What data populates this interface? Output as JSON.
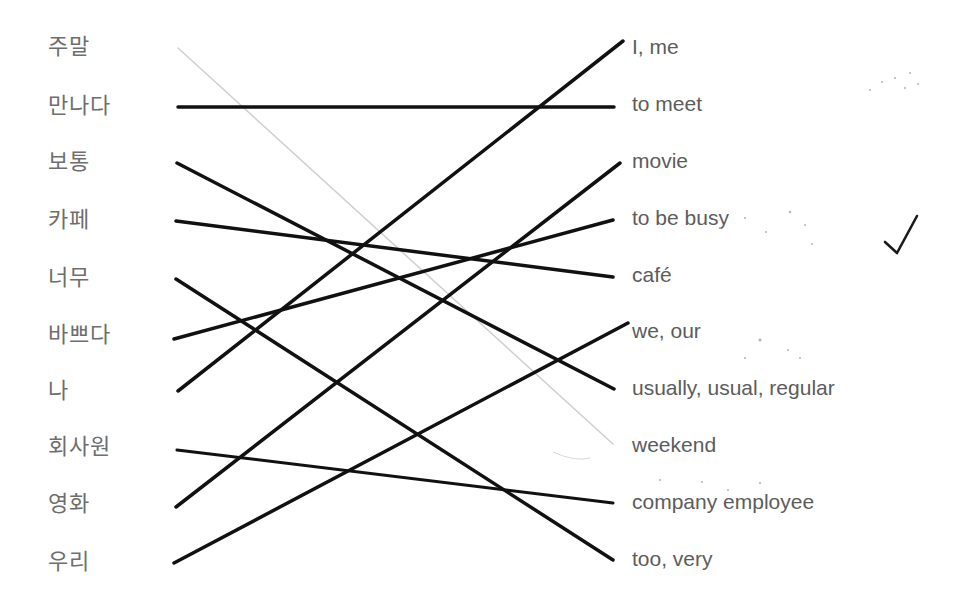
{
  "korean_words": [
    {
      "text": "주말",
      "y": 48
    },
    {
      "text": "만나다",
      "y": 107
    },
    {
      "text": "보통",
      "y": 163
    },
    {
      "text": "카페",
      "y": 221
    },
    {
      "text": "너무",
      "y": 279
    },
    {
      "text": "바쁘다",
      "y": 336
    },
    {
      "text": "나",
      "y": 392
    },
    {
      "text": "회사원",
      "y": 448
    },
    {
      "text": "영화",
      "y": 505
    },
    {
      "text": "우리",
      "y": 563
    }
  ],
  "english_words": [
    {
      "text": "I, me",
      "y": 48
    },
    {
      "text": "to meet",
      "y": 105
    },
    {
      "text": "movie",
      "y": 162
    },
    {
      "text": "to be busy",
      "y": 219
    },
    {
      "text": "café",
      "y": 276
    },
    {
      "text": "we, our",
      "y": 332
    },
    {
      "text": "usually, usual, regular",
      "y": 389
    },
    {
      "text": "weekend",
      "y": 446
    },
    {
      "text": "company employee",
      "y": 503
    },
    {
      "text": "too, very",
      "y": 560
    }
  ],
  "matches": [
    {
      "from": "주말",
      "to": "weekend",
      "x1": 178,
      "y1": 48,
      "x2": 613,
      "y2": 444,
      "color": "#cfcfcf",
      "width": 1.5
    },
    {
      "from": "만나다",
      "to": "to meet",
      "x1": 178,
      "y1": 107,
      "x2": 614,
      "y2": 107,
      "color": "#111111",
      "width": 3.5
    },
    {
      "from": "보통",
      "to": "usually, usual, regular",
      "x1": 177,
      "y1": 163,
      "x2": 614,
      "y2": 389,
      "color": "#111111",
      "width": 3.5
    },
    {
      "from": "카페",
      "to": "café",
      "x1": 176,
      "y1": 221,
      "x2": 613,
      "y2": 277,
      "color": "#111111",
      "width": 3.5
    },
    {
      "from": "너무",
      "to": "too, very",
      "x1": 176,
      "y1": 279,
      "x2": 613,
      "y2": 560,
      "color": "#111111",
      "width": 3.5
    },
    {
      "from": "바쁘다",
      "to": "to be busy",
      "x1": 174,
      "y1": 339,
      "x2": 613,
      "y2": 220,
      "color": "#111111",
      "width": 3.5
    },
    {
      "from": "나",
      "to": "I, me",
      "x1": 178,
      "y1": 391,
      "x2": 623,
      "y2": 41,
      "color": "#111111",
      "width": 3.5
    },
    {
      "from": "회사원",
      "to": "company employee",
      "x1": 177,
      "y1": 450,
      "x2": 613,
      "y2": 503,
      "color": "#111111",
      "width": 3
    },
    {
      "from": "영화",
      "to": "movie",
      "x1": 176,
      "y1": 507,
      "x2": 620,
      "y2": 163,
      "color": "#111111",
      "width": 3.5
    },
    {
      "from": "우리",
      "to": "we, our",
      "x1": 174,
      "y1": 563,
      "x2": 628,
      "y2": 323,
      "color": "#111111",
      "width": 3.5
    }
  ],
  "checkmark": {
    "symbol": "✓",
    "x": 883,
    "y": 212,
    "color": "#1a1a1a"
  }
}
